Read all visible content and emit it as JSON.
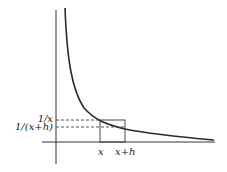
{
  "diagram": {
    "type": "function-graph",
    "function": "y = 1/x",
    "labels": {
      "y_upper": "1/x",
      "y_lower": "1/(x+h)",
      "x_left": "x",
      "x_right": "x+h"
    },
    "colors": {
      "curve": "#2a2a2a",
      "axes": "#333333",
      "rectangle": "#333333",
      "dashed": "#444444",
      "background": "#ffffff"
    }
  }
}
